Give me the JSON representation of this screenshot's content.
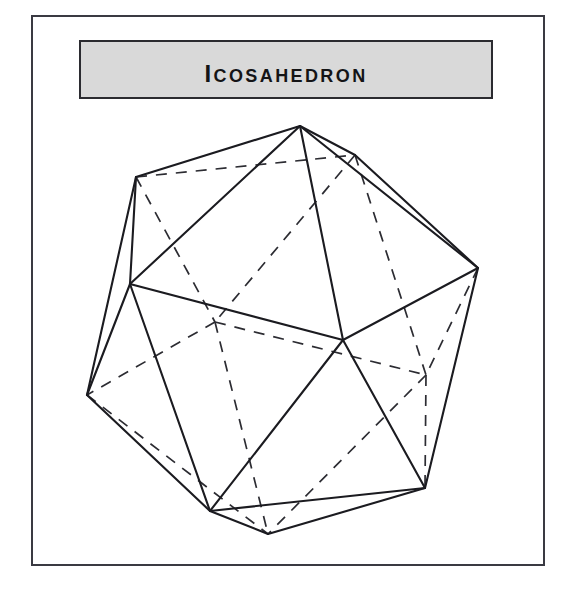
{
  "page": {
    "background_color": "#ffffff",
    "width": 572,
    "height": 593
  },
  "frame": {
    "name": "outer-frame",
    "border_color": "#3a3a42",
    "fill_color": "#ffffff"
  },
  "title_plate": {
    "label": "Icosahedron",
    "fill_color": "#d9d9d9",
    "border_color": "#2b2b30",
    "text_color": "#141416"
  },
  "figure": {
    "name": "icosahedron-wireframe",
    "solid_name": "Icosahedron",
    "faces": 20,
    "edges": 30,
    "vertices": 12,
    "solid_edge_color": "#1b1b20",
    "hidden_edge_color": "#2c2c32",
    "hidden_edge_style": "dashed",
    "viewbox": "0 0 510 547",
    "points": {
      "apex": [
        267,
        109
      ],
      "upper_left": [
        103,
        160
      ],
      "upper_right": [
        322,
        138
      ],
      "right": [
        445,
        251
      ],
      "mid_left": [
        97,
        267
      ],
      "center": [
        310,
        323
      ],
      "lower_left": [
        54,
        378
      ],
      "bottom_left": [
        177,
        494
      ],
      "bottom": [
        235,
        517
      ],
      "lower_right": [
        392,
        471
      ],
      "hidden_left": [
        182,
        305
      ],
      "hidden_right": [
        393,
        358
      ]
    },
    "solid_edges": [
      [
        "apex",
        "upper_left"
      ],
      [
        "apex",
        "upper_right"
      ],
      [
        "apex",
        "right"
      ],
      [
        "apex",
        "mid_left"
      ],
      [
        "apex",
        "center"
      ],
      [
        "upper_left",
        "mid_left"
      ],
      [
        "upper_left",
        "lower_left"
      ],
      [
        "upper_right",
        "right"
      ],
      [
        "mid_left",
        "center"
      ],
      [
        "mid_left",
        "lower_left"
      ],
      [
        "mid_left",
        "bottom_left"
      ],
      [
        "right",
        "center"
      ],
      [
        "right",
        "lower_right"
      ],
      [
        "center",
        "bottom_left"
      ],
      [
        "center",
        "lower_right"
      ],
      [
        "lower_left",
        "bottom_left"
      ],
      [
        "bottom_left",
        "bottom"
      ],
      [
        "bottom_left",
        "lower_right"
      ],
      [
        "bottom",
        "lower_right"
      ]
    ],
    "hidden_edges": [
      [
        "upper_left",
        "upper_right"
      ],
      [
        "upper_left",
        "hidden_left"
      ],
      [
        "upper_right",
        "hidden_left"
      ],
      [
        "upper_right",
        "hidden_right"
      ],
      [
        "right",
        "hidden_right"
      ],
      [
        "hidden_left",
        "lower_left"
      ],
      [
        "hidden_left",
        "hidden_right"
      ],
      [
        "hidden_left",
        "bottom"
      ],
      [
        "hidden_right",
        "bottom"
      ],
      [
        "hidden_right",
        "lower_right"
      ],
      [
        "lower_left",
        "bottom"
      ]
    ]
  }
}
